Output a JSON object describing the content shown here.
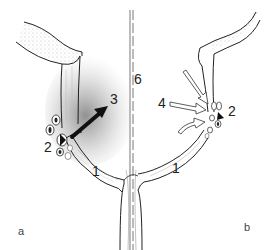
{
  "figure": {
    "panels": [
      {
        "id": "a",
        "label": "a"
      },
      {
        "id": "b",
        "label": "b"
      }
    ],
    "labels": [
      {
        "text": "1",
        "panel": "a",
        "x": 94,
        "y": 171
      },
      {
        "text": "2",
        "panel": "a",
        "x": 47,
        "y": 144
      },
      {
        "text": "3",
        "panel": "a",
        "x": 112,
        "y": 95
      },
      {
        "text": "6",
        "panel": "shared",
        "x": 135,
        "y": 74
      },
      {
        "text": "1",
        "panel": "b",
        "x": 171,
        "y": 166
      },
      {
        "text": "2",
        "panel": "b",
        "x": 228,
        "y": 108
      },
      {
        "text": "4",
        "panel": "b",
        "x": 158,
        "y": 100
      }
    ],
    "colors": {
      "line": "#222222",
      "fill_light": "#f2f2f2",
      "stipple": "#9a9a9a",
      "arrow_dark": "#111111",
      "arrow_open": "#ffffff"
    }
  }
}
